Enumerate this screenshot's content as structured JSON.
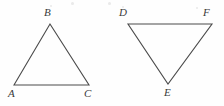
{
  "figure": {
    "background_color": "#fefefe",
    "stroke_color": "#4a4a4a",
    "label_color": "#3a3a3a",
    "stroke_width": 1.1,
    "triangles": [
      {
        "name": "triangle-abc",
        "orientation": "apex-up",
        "vertices": [
          {
            "label": "A",
            "x": 14,
            "y": 85,
            "label_x": 8,
            "label_y": 88
          },
          {
            "label": "B",
            "x": 50,
            "y": 24,
            "label_x": 44,
            "label_y": 7
          },
          {
            "label": "C",
            "x": 89,
            "y": 85,
            "label_x": 84,
            "label_y": 88
          }
        ],
        "sides": [
          "AB",
          "BC",
          "CA"
        ],
        "points_path": "14,85 50,24 89,85"
      },
      {
        "name": "triangle-def",
        "orientation": "apex-down",
        "vertices": [
          {
            "label": "D",
            "x": 128,
            "y": 24,
            "label_x": 119,
            "label_y": 7
          },
          {
            "label": "F",
            "x": 212,
            "y": 24,
            "label_x": 203,
            "label_y": 7
          },
          {
            "label": "E",
            "x": 168,
            "y": 84,
            "label_x": 164,
            "label_y": 87
          }
        ],
        "sides": [
          "DF",
          "FE",
          "ED"
        ],
        "points_path": "128,24 212,24 168,84"
      }
    ],
    "specks": [
      {
        "x": 71,
        "y": 2,
        "size": 3
      },
      {
        "x": 108,
        "y": 2,
        "size": 3
      },
      {
        "x": 50,
        "y": 5,
        "size": 2
      },
      {
        "x": 122,
        "y": 6,
        "size": 2
      },
      {
        "x": 196,
        "y": 7,
        "size": 2
      }
    ]
  }
}
